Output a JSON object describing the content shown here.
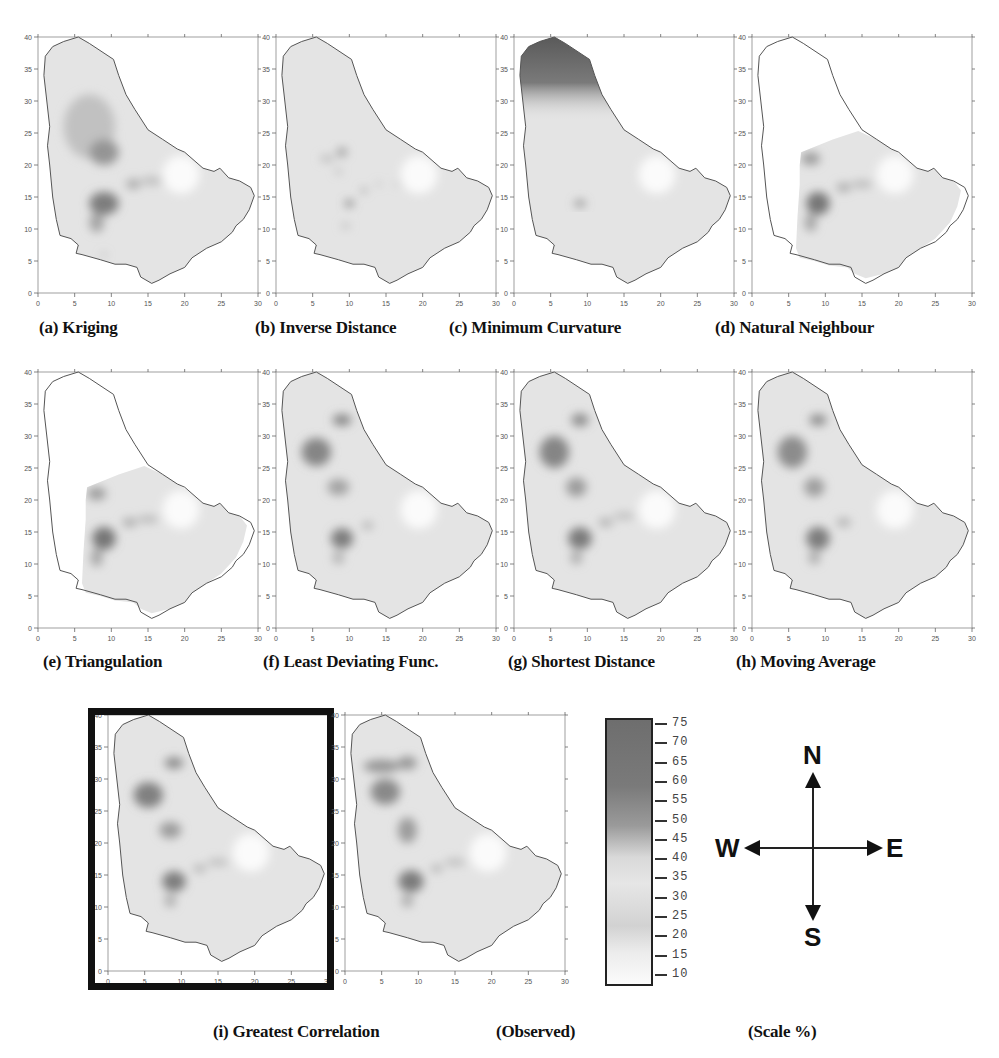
{
  "figure": {
    "panels": [
      {
        "id": "a",
        "caption": "(a) Kriging",
        "region": "full",
        "north_dark": false,
        "blobs": [
          [
            7,
            26,
            3.5,
            5,
            0.25
          ],
          [
            9,
            22,
            2,
            2,
            0.55
          ],
          [
            9,
            14,
            2,
            1.8,
            0.7
          ],
          [
            8,
            11,
            1,
            1.5,
            0.45
          ],
          [
            13,
            17,
            1,
            0.8,
            0.4
          ],
          [
            15.5,
            17.5,
            1.5,
            0.6,
            0.3
          ],
          [
            9,
            6,
            0.3,
            0.3,
            0.5
          ]
        ]
      },
      {
        "id": "b",
        "caption": "(b) Inverse Distance",
        "region": "full",
        "north_dark": false,
        "blobs": [
          [
            9,
            22,
            0.7,
            0.7,
            0.5
          ],
          [
            7,
            21,
            1,
            0.5,
            0.3
          ],
          [
            10,
            14,
            0.6,
            0.5,
            0.7
          ],
          [
            12,
            16,
            0.4,
            0.4,
            0.5
          ],
          [
            14,
            17,
            0.3,
            0.3,
            0.4
          ],
          [
            8.5,
            19,
            0.4,
            0.4,
            0.35
          ],
          [
            9.5,
            10.5,
            0.6,
            0.4,
            0.3
          ],
          [
            16.5,
            17,
            0.3,
            0.3,
            0.35
          ]
        ]
      },
      {
        "id": "c",
        "caption": "(c) Minimum Curvature",
        "region": "full",
        "north_dark": true,
        "blobs": [
          [
            9,
            14,
            0.8,
            0.5,
            0.6
          ]
        ]
      },
      {
        "id": "d",
        "caption": "(d) Natural Neighbour",
        "region": "partial",
        "north_dark": false,
        "blobs": [
          [
            8,
            21,
            1.3,
            1,
            0.5
          ],
          [
            9,
            14,
            1.6,
            1.8,
            0.75
          ],
          [
            8,
            11,
            0.8,
            1.4,
            0.45
          ],
          [
            12.5,
            16.5,
            1,
            0.7,
            0.4
          ],
          [
            15,
            17,
            1.5,
            0.5,
            0.35
          ]
        ]
      },
      {
        "id": "e",
        "caption": "(e) Triangulation",
        "region": "partial",
        "north_dark": false,
        "blobs": [
          [
            8,
            21,
            1.3,
            1,
            0.5
          ],
          [
            9,
            14,
            1.6,
            1.8,
            0.75
          ],
          [
            8,
            11,
            0.8,
            1.4,
            0.45
          ],
          [
            12.5,
            16.5,
            1,
            0.7,
            0.4
          ],
          [
            15,
            17,
            1.5,
            0.5,
            0.35
          ]
        ]
      },
      {
        "id": "f",
        "caption": "(f) Least Deviating Func.",
        "region": "full",
        "north_dark": false,
        "blobs": [
          [
            9,
            32.5,
            1.3,
            0.9,
            0.65
          ],
          [
            5.5,
            27.5,
            2,
            2.2,
            0.65
          ],
          [
            8.5,
            22,
            1.5,
            1.3,
            0.45
          ],
          [
            9,
            14,
            1.5,
            1.6,
            0.7
          ],
          [
            8.5,
            11,
            0.8,
            1,
            0.35
          ],
          [
            12.5,
            16,
            0.8,
            0.6,
            0.35
          ]
        ]
      },
      {
        "id": "g",
        "caption": "(g) Shortest Distance",
        "region": "full",
        "north_dark": false,
        "blobs": [
          [
            9,
            32.5,
            1.2,
            1,
            0.6
          ],
          [
            5.5,
            27.5,
            2,
            2.5,
            0.65
          ],
          [
            8.5,
            22,
            1.4,
            1.5,
            0.5
          ],
          [
            9,
            14,
            1.6,
            1.7,
            0.72
          ],
          [
            8.5,
            11,
            0.8,
            1,
            0.4
          ],
          [
            12.5,
            16.5,
            1,
            0.7,
            0.35
          ],
          [
            15,
            17.5,
            1.5,
            0.5,
            0.3
          ]
        ]
      },
      {
        "id": "h",
        "caption": "(h) Moving Average",
        "region": "full",
        "north_dark": false,
        "blobs": [
          [
            9,
            32.5,
            1.2,
            0.9,
            0.6
          ],
          [
            5.5,
            27.5,
            2,
            2.5,
            0.6
          ],
          [
            8.5,
            22,
            1.4,
            1.5,
            0.48
          ],
          [
            9,
            14,
            1.6,
            1.8,
            0.7
          ],
          [
            8.5,
            11,
            0.8,
            1,
            0.4
          ],
          [
            12.5,
            16.5,
            1,
            0.7,
            0.35
          ]
        ]
      },
      {
        "id": "i",
        "caption": "(i) Greatest Correlation",
        "region": "full",
        "north_dark": false,
        "highlighted": true,
        "blobs": [
          [
            9,
            32.5,
            1.3,
            0.9,
            0.62
          ],
          [
            5.5,
            27.5,
            2,
            2,
            0.68
          ],
          [
            8.5,
            22,
            1.5,
            1.3,
            0.5
          ],
          [
            9,
            14,
            1.6,
            1.6,
            0.7
          ],
          [
            8.5,
            11,
            0.8,
            1,
            0.38
          ],
          [
            12.5,
            16,
            0.9,
            0.6,
            0.35
          ],
          [
            15,
            17,
            1.5,
            0.5,
            0.3
          ]
        ]
      },
      {
        "id": "obs",
        "caption": "(Observed)",
        "region": "full",
        "north_dark": false,
        "blobs": [
          [
            5,
            32,
            2.5,
            1,
            0.55
          ],
          [
            8.5,
            32.5,
            1.3,
            1,
            0.55
          ],
          [
            5.5,
            28,
            2,
            2,
            0.62
          ],
          [
            8.5,
            22,
            1.3,
            2,
            0.5
          ],
          [
            9,
            14,
            1.7,
            1.7,
            0.72
          ],
          [
            8.5,
            11,
            0.8,
            1,
            0.4
          ],
          [
            12.5,
            16,
            0.8,
            0.6,
            0.35
          ],
          [
            15,
            17,
            1.5,
            0.5,
            0.3
          ]
        ]
      }
    ],
    "axes": {
      "x_ticks": [
        "0",
        "5",
        "10",
        "15",
        "20",
        "25",
        "30"
      ],
      "y_ticks": [
        "0",
        "5",
        "10",
        "15",
        "20",
        "25",
        "30",
        "35",
        "40"
      ],
      "xlim": [
        0,
        30
      ],
      "ylim": [
        0,
        40
      ]
    },
    "scale": {
      "caption": "(Scale %)",
      "ticks": [
        "75",
        "70",
        "65",
        "60",
        "55",
        "50",
        "45",
        "40",
        "35",
        "30",
        "25",
        "20",
        "15",
        "10"
      ]
    },
    "compass": {
      "north": "N",
      "south": "S",
      "east": "E",
      "west": "W"
    }
  }
}
